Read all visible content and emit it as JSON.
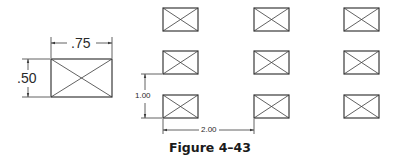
{
  "figure": {
    "caption": "Figure 4–43",
    "line_color": "#3a3a3a",
    "single_rect": {
      "width_label": ".75",
      "height_label": ".50"
    },
    "array": {
      "rows": 3,
      "columns": 3,
      "row_spacing_label": "1.00",
      "column_spacing_label": "2.00"
    }
  }
}
